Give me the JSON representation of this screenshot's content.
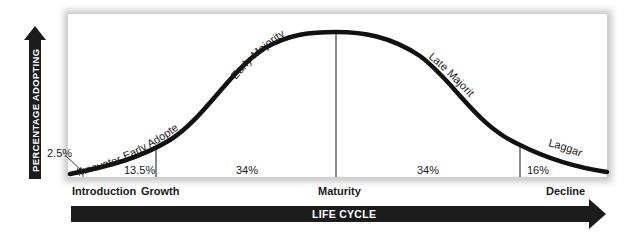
{
  "diagram": {
    "y_axis_label": "PERCENTAGE ADOPTING",
    "x_axis_label": "LIFE CYCLE",
    "adopter_groups": [
      {
        "name": "Innovators",
        "share": "2.5%"
      },
      {
        "name": "Early Adopters",
        "share": "13.5%"
      },
      {
        "name": "Early Majority",
        "share": "34%"
      },
      {
        "name": "Late Majority",
        "share": "34%"
      },
      {
        "name": "Laggards",
        "share": "16%"
      }
    ],
    "stages": [
      "Introduction",
      "Growth",
      "Maturity",
      "Decline"
    ],
    "colors": {
      "curve": "#111111",
      "divider": "#8a8a8a",
      "arrow": "#1c1c1c",
      "frame_shadow": "#d4d4d4"
    }
  }
}
